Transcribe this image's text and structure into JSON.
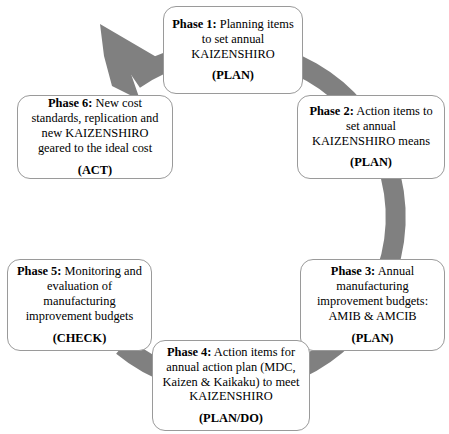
{
  "diagram": {
    "type": "cyclical-process",
    "ring_color": "#808080",
    "box_border_color": "#9a9a9a",
    "background_color": "#ffffff",
    "direction": "clockwise",
    "phases": [
      {
        "id": "phase-1",
        "label": "Phase 1:",
        "text": " Planning items to set annual KAIZENSHIRO",
        "tag": "(PLAN)"
      },
      {
        "id": "phase-2",
        "label": "Phase 2:",
        "text": " Action items to set annual KAIZENSHIRO means",
        "tag": "(PLAN)"
      },
      {
        "id": "phase-3",
        "label": "Phase 3:",
        "text": " Annual manufacturing improvement budgets: AMIB & AMCIB",
        "tag": "(PLAN)"
      },
      {
        "id": "phase-4",
        "label": "Phase 4:",
        "text": " Action items for annual action plan (MDC, Kaizen & Kaikaku) to meet KAIZENSHIRO",
        "tag": "(PLAN/DO)"
      },
      {
        "id": "phase-5",
        "label": "Phase 5:",
        "text": " Monitoring and evaluation of manufacturing improvement budgets",
        "tag": "(CHECK)"
      },
      {
        "id": "phase-6",
        "label": "Phase 6:",
        "text": " New cost standards, replication and new KAIZENSHIRO geared to the ideal cost",
        "tag": "(ACT)"
      }
    ],
    "arrow": {
      "name": "clockwise-cycle-arrow",
      "head_points_to": "phase-1"
    }
  }
}
